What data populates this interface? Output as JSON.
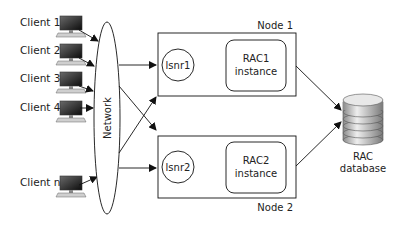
{
  "diagram": {
    "clients": [
      {
        "label": "Client 1"
      },
      {
        "label": "Client 2"
      },
      {
        "label": "Client 3"
      },
      {
        "label": "Client 4"
      },
      {
        "label": "Client n"
      }
    ],
    "network": {
      "label": "Network"
    },
    "nodes": [
      {
        "label": "Node 1",
        "listener": "lsnr1",
        "instance_line1": "RAC1",
        "instance_line2": "instance"
      },
      {
        "label": "Node 2",
        "listener": "lsnr2",
        "instance_line1": "RAC2",
        "instance_line2": "instance"
      }
    ],
    "database": {
      "line1": "RAC",
      "line2": "database"
    }
  }
}
